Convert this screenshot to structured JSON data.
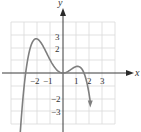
{
  "chart_data": {
    "type": "line",
    "title": "",
    "xlabel": "x",
    "ylabel": "y",
    "xlim": [
      -4,
      4
    ],
    "ylim": [
      -4,
      4
    ],
    "grid": true,
    "legend": null,
    "x_tick_labels": [
      "−2",
      "−1",
      "1",
      "2",
      "3"
    ],
    "x_tick_values": [
      -2,
      -1,
      1,
      2,
      3
    ],
    "y_tick_labels": [
      "3",
      "2",
      "−2",
      "−3"
    ],
    "y_tick_values": [
      3,
      2,
      -2,
      -3
    ],
    "series": [
      {
        "name": "polynomial curve",
        "description": "Quartic with negative leading coefficient; both ends point downward",
        "features": {
          "x_intercepts": [
            -2.85,
            0,
            1.6
          ],
          "local_max_left": [
            -2,
            2.7
          ],
          "local_min": [
            0,
            0
          ],
          "local_max_right": [
            0.9,
            0.45
          ],
          "end_behavior": "down-left and down-right arrows"
        },
        "x": [
          -3.3,
          -3.0,
          -2.85,
          -2.5,
          -2.0,
          -1.5,
          -1.0,
          -0.5,
          0,
          0.5,
          0.9,
          1.2,
          1.6,
          1.9,
          2.1
        ],
        "y": [
          -3.9,
          -1.3,
          0,
          1.9,
          2.7,
          2.1,
          1.0,
          0.3,
          0,
          0.33,
          0.45,
          0.35,
          0,
          -1.2,
          -3.9
        ]
      }
    ],
    "colors": {
      "curve": "#7f7f7f",
      "grid": "#d9d9d9",
      "axis": "#3a3a3a"
    }
  },
  "labels": {
    "x_axis": "x",
    "y_axis": "y",
    "x_ticks": [
      "−2",
      "−1",
      "1",
      "2",
      "3"
    ],
    "y_ticks": [
      "3",
      "2",
      "−2",
      "−3"
    ]
  }
}
